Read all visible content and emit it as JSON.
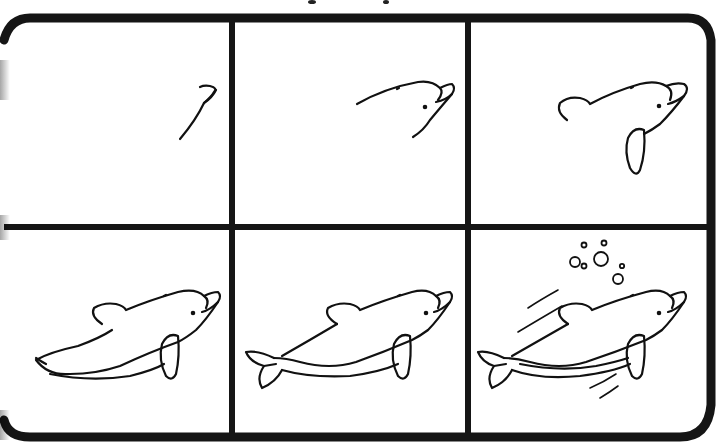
{
  "title": "How to draw a dolphin",
  "frame": {
    "border_color": "#151515",
    "background": "#ffffff",
    "rows": 2,
    "columns": 3
  },
  "steps": [
    {
      "index": 1,
      "label": "Step 1",
      "description": "Draw the curved beak line"
    },
    {
      "index": 2,
      "label": "Step 2",
      "description": "Add the head outline, eye and blowhole"
    },
    {
      "index": 3,
      "label": "Step 3",
      "description": "Add the back curve and the flipper"
    },
    {
      "index": 4,
      "label": "Step 4",
      "description": "Add the dorsal fin and the body"
    },
    {
      "index": 5,
      "label": "Step 5",
      "description": "Add the tail flukes"
    },
    {
      "index": 6,
      "label": "Step 6",
      "description": "Add the belly line, bubbles and motion lines"
    }
  ]
}
